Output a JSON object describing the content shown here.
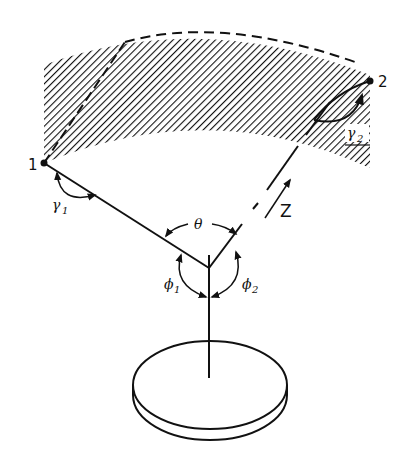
{
  "figure": {
    "colors": {
      "ink": "#111111",
      "background": "#ffffff",
      "hatch": "#111111"
    }
  },
  "points": [
    {
      "id": "1",
      "label": "1"
    },
    {
      "id": "2",
      "label": "2"
    }
  ],
  "angles": {
    "gamma1": {
      "symbol": "γ",
      "subscript": "1"
    },
    "gamma2": {
      "symbol": "γ",
      "subscript": "2"
    },
    "theta": {
      "symbol": "θ"
    },
    "phi1": {
      "symbol": "ϕ",
      "subscript": "1"
    },
    "phi2": {
      "symbol": "ϕ",
      "subscript": "2"
    }
  },
  "axis": {
    "z_label": "Z"
  },
  "elements": {
    "hatched_band": "shaded scan region between two arcs",
    "sample_disk": "circular disk seen in perspective",
    "normal_line": "vertical stem from disk to vertex"
  }
}
